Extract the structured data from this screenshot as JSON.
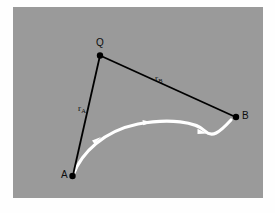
{
  "figure": {
    "type": "vector-diagram",
    "background_color": "#9a9a9a",
    "page_color": "#fefefe",
    "panel": {
      "x": 13,
      "y": 7,
      "width": 250,
      "height": 191
    },
    "points": [
      {
        "id": "Q",
        "label": "Q",
        "x": 100,
        "y": 55,
        "color": "#000000",
        "radius": 3.2
      },
      {
        "id": "A",
        "label": "A",
        "x": 72,
        "y": 176,
        "color": "#000000",
        "radius": 3.2
      },
      {
        "id": "B",
        "label": "B",
        "x": 236,
        "y": 117,
        "color": "#000000",
        "radius": 3.2
      }
    ],
    "vectors": [
      {
        "id": "rA",
        "label": "r",
        "subscript": "A",
        "from": "Q",
        "to": "A",
        "color": "#000000",
        "width": 1.8
      },
      {
        "id": "rB",
        "label": "r",
        "subscript": "B",
        "from": "Q",
        "to": "B",
        "color": "#000000",
        "width": 1.8
      }
    ],
    "path": {
      "id": "trajectory",
      "from": "A",
      "to": "B",
      "color": "#ffffff",
      "width": 3.0,
      "arrow_count": 3,
      "shape": "s-curve"
    }
  }
}
